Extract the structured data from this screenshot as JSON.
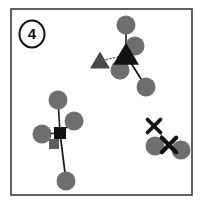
{
  "figure": {
    "panel_label": "4",
    "panel_label_style": "circled-number",
    "background_color": "#ffffff",
    "frame": {
      "x": 11,
      "y": 9,
      "width": 181,
      "height": 186,
      "stroke_color": "#3a3a3a",
      "stroke_width": 1.6,
      "fill": "#ffffff"
    },
    "palette": {
      "circle_gray": "#6e6e6e",
      "marker_black": "#121212",
      "marker_gray": "#6a6a6a",
      "link_solid": "#1a1a1a",
      "link_dotted": "#555555",
      "frame_stroke": "#3a3a3a"
    }
  },
  "chart_data": {
    "type": "scatter",
    "title": "",
    "xlabel": "",
    "ylabel": "",
    "xlim": [
      0,
      201
    ],
    "ylim": [
      0,
      204
    ],
    "grid": false,
    "legend": null,
    "annotations": [
      {
        "name": "panel-number",
        "text": "4",
        "x": 32,
        "y": 39,
        "style": "circled"
      }
    ],
    "series": [
      {
        "name": "detections",
        "marker": "circle",
        "color": "#6e6e6e",
        "radius": 9.5,
        "points": [
          {
            "id": "c1",
            "x": 126,
            "y": 25,
            "group": "triangle-cluster"
          },
          {
            "id": "c2",
            "x": 135,
            "y": 46,
            "group": "triangle-cluster"
          },
          {
            "id": "c3",
            "x": 120,
            "y": 70,
            "group": "triangle-cluster"
          },
          {
            "id": "c4",
            "x": 146,
            "y": 87,
            "group": "triangle-cluster"
          },
          {
            "id": "c5",
            "x": 58,
            "y": 100,
            "group": "square-cluster"
          },
          {
            "id": "c6",
            "x": 74,
            "y": 121,
            "group": "square-cluster"
          },
          {
            "id": "c7",
            "x": 42,
            "y": 134,
            "group": "square-cluster"
          },
          {
            "id": "c8",
            "x": 66,
            "y": 181,
            "group": "square-cluster"
          },
          {
            "id": "c9",
            "x": 155,
            "y": 146,
            "group": "cross-cluster"
          },
          {
            "id": "c10",
            "x": 181,
            "y": 150,
            "group": "cross-cluster"
          }
        ]
      },
      {
        "name": "triangle-markers",
        "marker": "triangle",
        "points": [
          {
            "id": "t1",
            "x": 126,
            "y": 55,
            "size": 13,
            "color": "#121212"
          },
          {
            "id": "t2",
            "x": 100,
            "y": 61,
            "size": 10,
            "color": "#4a4a4a"
          }
        ]
      },
      {
        "name": "square-markers",
        "marker": "square",
        "points": [
          {
            "id": "s1",
            "x": 60,
            "y": 133,
            "size": 12,
            "color": "#121212"
          },
          {
            "id": "s2",
            "x": 54,
            "y": 144,
            "size": 10,
            "color": "#5e5e5e"
          }
        ]
      },
      {
        "name": "cross-markers",
        "marker": "x",
        "points": [
          {
            "id": "x1",
            "x": 154,
            "y": 126,
            "size": 9,
            "color": "#121212"
          },
          {
            "id": "x2",
            "x": 169,
            "y": 145,
            "size": 10,
            "color": "#121212"
          }
        ]
      }
    ],
    "edges": [
      {
        "id": "e1",
        "from": [
          126,
          55
        ],
        "to": [
          126,
          25
        ],
        "style": "solid",
        "color": "#1a1a1a",
        "width": 1.6
      },
      {
        "id": "e2",
        "from": [
          126,
          55
        ],
        "to": [
          135,
          46
        ],
        "style": "solid",
        "color": "#1a1a1a",
        "width": 1.6
      },
      {
        "id": "e3",
        "from": [
          126,
          55
        ],
        "to": [
          120,
          70
        ],
        "style": "solid",
        "color": "#1a1a1a",
        "width": 1.6
      },
      {
        "id": "e4",
        "from": [
          126,
          55
        ],
        "to": [
          146,
          87
        ],
        "style": "solid",
        "color": "#1a1a1a",
        "width": 1.8
      },
      {
        "id": "e5",
        "from": [
          126,
          55
        ],
        "to": [
          100,
          61
        ],
        "style": "dotted",
        "color": "#555555",
        "width": 1.2
      },
      {
        "id": "e6",
        "from": [
          60,
          133
        ],
        "to": [
          58,
          100
        ],
        "style": "solid",
        "color": "#1a1a1a",
        "width": 1.6
      },
      {
        "id": "e7",
        "from": [
          60,
          133
        ],
        "to": [
          74,
          121
        ],
        "style": "solid",
        "color": "#1a1a1a",
        "width": 1.6
      },
      {
        "id": "e8",
        "from": [
          60,
          133
        ],
        "to": [
          42,
          134
        ],
        "style": "solid",
        "color": "#1a1a1a",
        "width": 1.6
      },
      {
        "id": "e9",
        "from": [
          60,
          133
        ],
        "to": [
          66,
          181
        ],
        "style": "solid",
        "color": "#1a1a1a",
        "width": 1.8
      },
      {
        "id": "e10",
        "from": [
          60,
          133
        ],
        "to": [
          54,
          144
        ],
        "style": "solid",
        "color": "#3a3a3a",
        "width": 1.2
      },
      {
        "id": "e11",
        "from": [
          169,
          145
        ],
        "to": [
          154,
          126
        ],
        "style": "dotted",
        "color": "#555555",
        "width": 1.2
      }
    ]
  }
}
